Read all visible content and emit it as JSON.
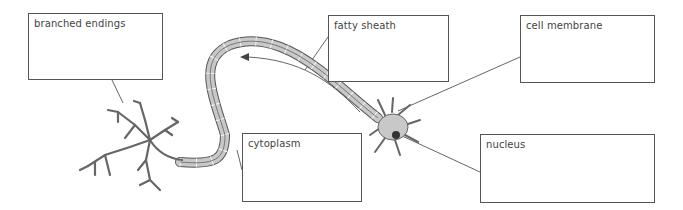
{
  "diagram": {
    "labels": [
      {
        "id": "branched-endings",
        "text": "branched endings",
        "box": [
          28,
          13,
          135,
          67
        ],
        "pointer": [
          [
            112,
            80
          ],
          [
            123,
            103
          ]
        ]
      },
      {
        "id": "fatty-sheath",
        "text": "fatty sheath",
        "box": [
          328,
          15,
          121,
          67
        ],
        "pointer": [
          [
            328,
            37
          ],
          [
            305,
            70
          ]
        ]
      },
      {
        "id": "cell-membrane",
        "text": "cell membrane",
        "box": [
          520,
          15,
          135,
          68
        ],
        "pointer": [
          [
            520,
            57
          ],
          [
            398,
            111
          ]
        ]
      },
      {
        "id": "cytoplasm",
        "text": "cytoplasm",
        "box": [
          242,
          133,
          120,
          69
        ],
        "pointer": [
          [
            242,
            170
          ],
          [
            237,
            150
          ]
        ]
      },
      {
        "id": "nucleus",
        "text": "nucleus",
        "box": [
          480,
          134,
          175,
          69
        ],
        "pointer": [
          [
            480,
            172
          ],
          [
            400,
            135
          ]
        ]
      }
    ],
    "colors": {
      "outline": "#555555",
      "fill": "#c8c8c8",
      "nucleus": "#333333",
      "text": "#444444"
    }
  }
}
